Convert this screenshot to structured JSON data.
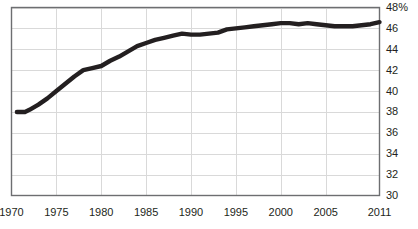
{
  "chart_data": {
    "type": "line",
    "title": "",
    "subtitle": "",
    "xlabel": "",
    "ylabel": "",
    "unit_label": "48%",
    "grid": true,
    "legend": "none",
    "line_color": "#231f20",
    "grid_color": "#d9d9d9",
    "axis_color": "#6d6e71",
    "xlim": [
      1970,
      2011
    ],
    "ylim": [
      30,
      48
    ],
    "x_ticks": [
      1970,
      1975,
      1980,
      1985,
      1990,
      1995,
      2000,
      2005,
      2011
    ],
    "x_tick_labels": [
      "1970",
      "1975",
      "1980",
      "1985",
      "1990",
      "1995",
      "2000",
      "2005",
      "2011"
    ],
    "y_ticks": [
      30,
      32,
      34,
      36,
      38,
      40,
      42,
      44,
      46,
      48
    ],
    "y_tick_labels": [
      "30",
      "32",
      "34",
      "36",
      "38",
      "40",
      "42",
      "44",
      "46",
      "48%"
    ],
    "series": [
      {
        "name": "share",
        "x": [
          1970.6,
          1971,
          1971.5,
          1972,
          1973,
          1974,
          1975,
          1976,
          1977,
          1978,
          1979,
          1980,
          1981,
          1982,
          1983,
          1984,
          1985,
          1986,
          1987,
          1988,
          1989,
          1990,
          1991,
          1992,
          1993,
          1994,
          1995,
          1996,
          1997,
          1998,
          1999,
          2000,
          2001,
          2002,
          2003,
          2004,
          2005,
          2006,
          2007,
          2008,
          2009,
          2010,
          2011
        ],
        "values": [
          38.0,
          38.0,
          38.0,
          38.2,
          38.7,
          39.3,
          40.0,
          40.7,
          41.4,
          42.0,
          42.2,
          42.4,
          42.9,
          43.3,
          43.8,
          44.3,
          44.6,
          44.9,
          45.1,
          45.3,
          45.5,
          45.4,
          45.4,
          45.5,
          45.6,
          45.9,
          46.0,
          46.1,
          46.2,
          46.3,
          46.4,
          46.5,
          46.5,
          46.4,
          46.5,
          46.4,
          46.3,
          46.2,
          46.2,
          46.2,
          46.3,
          46.4,
          46.6
        ]
      }
    ]
  },
  "axes": {
    "y_axis_name": "y-axis",
    "x_axis_name": "x-axis"
  }
}
